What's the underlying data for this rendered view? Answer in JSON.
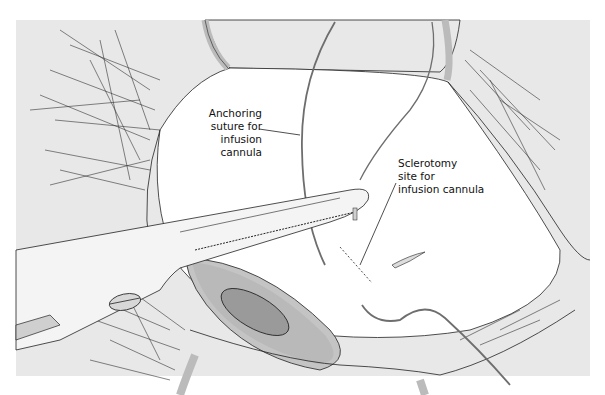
{
  "figure": {
    "labels": {
      "anchoring_suture": [
        "Anchoring",
        "suture for",
        "infusion",
        "cannula"
      ],
      "sclerotomy_site": [
        "Sclerotomy",
        "site for",
        "infusion cannula"
      ]
    },
    "colors": {
      "background_skin": "#e8e8e8",
      "sclera": "#ffffff",
      "cornea_shadow": "#b9b9b9",
      "pupil": "#9a9a9a",
      "instrument": "#f4f4f4",
      "line": "#222222",
      "suture": "#6e6e6e"
    }
  }
}
